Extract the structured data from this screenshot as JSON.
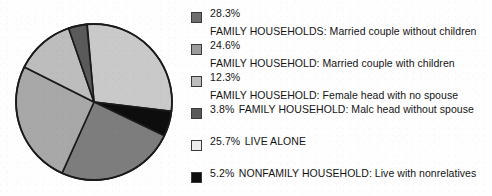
{
  "chart_data": {
    "type": "pie",
    "title": "",
    "subtitle": "",
    "xlabel": "",
    "ylabel": "",
    "legend_position": "right",
    "grid": false,
    "start_angle_deg": 355,
    "direction": "clockwise",
    "categories": [
      "FAMILY HOUSEHOLDS: Married couple without children",
      "FAMILY HOUSEHOLD: Married couple with children",
      "FAMILY HOUSEHOLD: Female head with no spouse",
      "FAMILY HOUSEHOLD: Malc head without spouse",
      "LIVE ALONE",
      "NONFAMILY HOUSEHOLD: Live with nonrelatives"
    ],
    "values": [
      28.3,
      24.6,
      12.3,
      3.8,
      25.7,
      5.2
    ],
    "value_labels": [
      "28.3%",
      "24.6%",
      "12.3%",
      "3.8%",
      "25.7%",
      "5.2%"
    ],
    "colors": [
      "#6e6e6e",
      "#9c9c9c",
      "#bdbdbd",
      "#5a5a5a",
      "#ededed",
      "#0d0d0d"
    ],
    "slice_outline_color": "#1a1a1a",
    "units": "percent"
  },
  "pie": {
    "center_x": 86,
    "center_y": 86,
    "radius": 78,
    "slices": [
      {
        "name": "married-couple-without-children",
        "value": 28.3,
        "color": "#c9c9c9",
        "start_deg": 355,
        "sweep_deg": 101.9
      },
      {
        "name": "live-with-nonrelatives",
        "value": 5.2,
        "color": "#0d0d0d",
        "start_deg": 96.9,
        "sweep_deg": 18.7
      },
      {
        "name": "married-couple-with-children",
        "value": 24.6,
        "color": "#7d7d7d",
        "start_deg": 115.6,
        "sweep_deg": 88.6
      },
      {
        "name": "live-alone",
        "value": 25.7,
        "color": "#a8a8a8",
        "start_deg": 204.2,
        "sweep_deg": 92.5
      },
      {
        "name": "female-head-no-spouse",
        "value": 12.3,
        "color": "#bdbdbd",
        "start_deg": 296.7,
        "sweep_deg": 44.3
      },
      {
        "name": "male-head-without-spouse",
        "value": 3.8,
        "color": "#5a5a5a",
        "start_deg": 341.0,
        "sweep_deg": 13.7
      }
    ]
  },
  "legend": {
    "items": [
      {
        "swatch_name": "legend-swatch-married-couple-without-children",
        "color": "#6e6e6e",
        "percent": "28.3%",
        "label": "FAMILY HOUSEHOLDS: Married couple without children"
      },
      {
        "swatch_name": "legend-swatch-married-couple-with-children",
        "color": "#9c9c9c",
        "percent": "24.6%",
        "label": "FAMILY HOUSEHOLD: Married couple with children"
      },
      {
        "swatch_name": "legend-swatch-female-head-no-spouse",
        "color": "#bdbdbd",
        "percent": "12.3%",
        "label": "FAMILY HOUSEHOLD: Female head with no spouse"
      },
      {
        "swatch_name": "legend-swatch-male-head-without-spouse",
        "color": "#5a5a5a",
        "percent": "3.8%",
        "label": "FAMILY HOUSEHOLD: Malc head without spouse"
      },
      {
        "swatch_name": "legend-swatch-live-alone",
        "color": "#ededed",
        "percent": "25.7%",
        "label": "LIVE ALONE"
      },
      {
        "swatch_name": "legend-swatch-live-with-nonrelatives",
        "color": "#0d0d0d",
        "percent": "5.2%",
        "label": "NONFAMILY HOUSEHOLD: Live with nonrelatives"
      }
    ]
  }
}
